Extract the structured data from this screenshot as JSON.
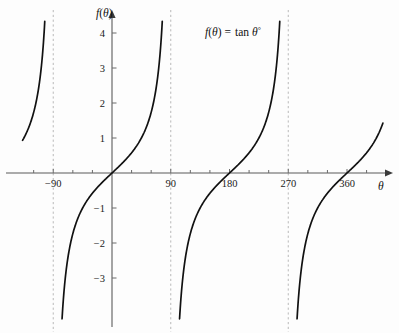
{
  "chart_data": {
    "type": "line",
    "title": "",
    "annotation": "f(θ) = tan θ°",
    "annotation_parts": {
      "fn_name": "f",
      "open": "(",
      "arg": "θ",
      "close": ")",
      "equals": "=",
      "tan": "tan",
      "theta": "θ",
      "degree": "°"
    },
    "xlabel": "θ",
    "ylabel": "f(θ)",
    "ylabel_parts": {
      "fn_name": "f",
      "open": "(",
      "arg": "θ",
      "close": ")"
    },
    "xlim": [
      -140,
      418
    ],
    "ylim": [
      -4.3,
      4.4
    ],
    "grid": false,
    "legend": "none",
    "x_ticks_major": [
      -90,
      90,
      180,
      270,
      360
    ],
    "x_tick_labels": [
      "−90",
      "90",
      "180",
      "270",
      "360"
    ],
    "x_ticks_minor": [
      -120,
      -60,
      -30,
      30,
      60,
      120,
      150,
      210,
      240,
      300,
      330,
      390
    ],
    "y_ticks": [
      4,
      3,
      2,
      1,
      -1,
      -2,
      -3
    ],
    "y_tick_labels": [
      "4",
      "3",
      "2",
      "1",
      "−1",
      "−2",
      "−3"
    ],
    "asymptotes": [
      -90,
      90,
      270
    ],
    "asymptote_style": "dashed",
    "period": 180,
    "branches": [
      {
        "name": "branch-left-partial",
        "x_start": -137,
        "x_end": -93,
        "clip_top": 4.4,
        "clip_bottom": -4.3
      },
      {
        "name": "branch-origin",
        "x_start": -87,
        "x_end": 87,
        "clip_top": 4.4,
        "clip_bottom": -4.3
      },
      {
        "name": "branch-180",
        "x_start": 93,
        "x_end": 267,
        "clip_top": 4.4,
        "clip_bottom": -4.3
      },
      {
        "name": "branch-360",
        "x_start": 273,
        "x_end": 415,
        "clip_top": 4.4,
        "clip_bottom": -4.3
      }
    ],
    "x_crossings": [
      0,
      180,
      360
    ],
    "colors": {
      "curve": "#111111",
      "axis": "#5b5b5b",
      "asymptote": "#b9b9b9",
      "background": "#fdfdfd",
      "text": "#1a1a1a"
    }
  }
}
